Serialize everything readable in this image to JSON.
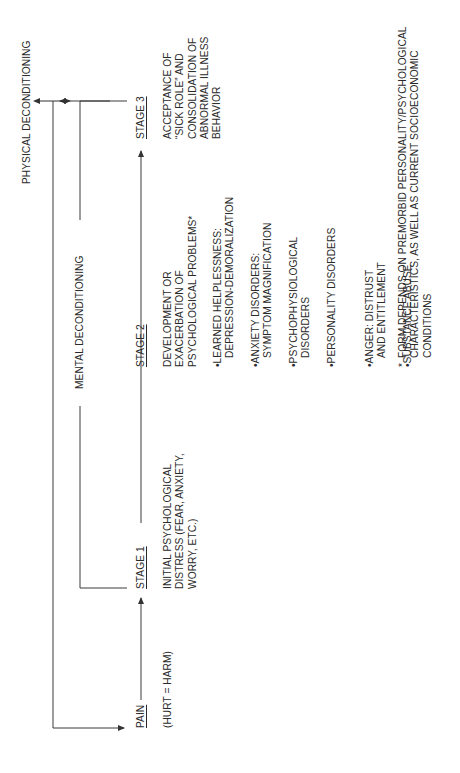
{
  "diagram": {
    "orientation": "rotated-90-ccw",
    "top_labels": {
      "physical": "PHYSICAL DECONDITIONING",
      "mental": "MENTAL DECONDITIONING"
    },
    "stages": [
      {
        "label": "PAIN",
        "desc": [
          "(HURT = HARM)"
        ]
      },
      {
        "label": "STAGE 1",
        "desc": [
          "INITIAL PSYCHOLOGICAL",
          "DISTRESS (FEAR, ANXIETY,",
          "WORRY, ETC.)"
        ]
      },
      {
        "label": "STAGE 2",
        "desc": [
          "DEVELOPMENT OR",
          "EXACERBATION OF",
          "PSYCHOLOGICAL PROBLEMS*"
        ]
      },
      {
        "label": "STAGE 3",
        "desc": [
          "ACCEPTANCE OF",
          "“SICK ROLE” AND",
          "CONSOLIDATION OF",
          "ABNORMAL ILLNESS",
          "BEHAVIOR"
        ]
      }
    ],
    "stage2_bullets": [
      [
        "LEARNED HELPLESSNESS:",
        "DEPRESSION-DEMORALIZATION"
      ],
      [
        "ANXIETY DISORDERS:",
        "SYMPTOM MAGNIFICATION"
      ],
      [
        "PSYCHOPHYSIOLOGICAL",
        "DISORDERS"
      ],
      [
        "PERSONALITY DISORDERS"
      ],
      [
        "ANGER: DISTRUST",
        "AND ENTITLEMENT"
      ],
      [
        "SUBSTANCE ABUSE"
      ]
    ],
    "bullet_char": "•",
    "footnote": {
      "marker": "*",
      "lines": [
        "FORM DEPENDS ON PREMORBID PERSONALITY/PSYCHOLOGICAL",
        "CHARACTERISTICS, AS WELL AS CURRENT SOCIOECONOMIC",
        "CONDITIONS"
      ]
    }
  }
}
